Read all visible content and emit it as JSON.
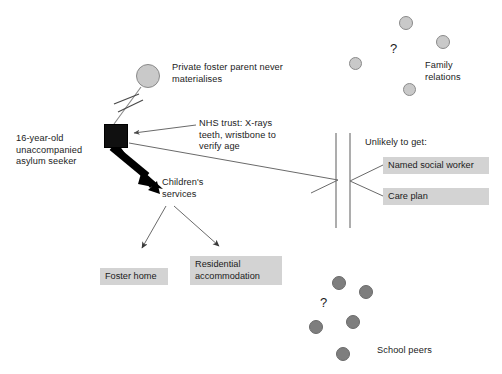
{
  "diagram": {
    "title_text": "",
    "canvas": {
      "width": 502,
      "height": 374,
      "background": "#ffffff"
    },
    "colors": {
      "ink": "#1b1b1b",
      "line": "#7a7a7a",
      "thick_arrow": "#000000",
      "box_fill": "#d3d3d3",
      "node_square_fill": "#101010",
      "circle_light_fill": "#c9c9c9",
      "circle_light_stroke": "#8a8a8a",
      "circle_dark_fill": "#7e7e7e",
      "circle_dark_stroke": "#6a6a6a"
    }
  },
  "labels": {
    "focal_person": "16-year-old\nunaccompanied\nasylum seeker",
    "private_foster_parent": "Private foster parent never\nmaterialises",
    "nhs_trust": "NHS trust: X-rays\nteeth, wristbone to\nverify age",
    "childrens_services": "Children's\nservices",
    "unlikely_to_get": "Unlikely to get:",
    "family_relations": "Family\nrelations",
    "school_peers": "School peers",
    "question_family": "?",
    "question_peers": "?"
  },
  "boxes": {
    "named_social_worker": "Named social worker",
    "care_plan": "Care plan",
    "foster_home": "Foster home",
    "residential_accommodation": "Residential\naccommodation"
  },
  "nodes": {
    "focal_square": {
      "name": "focal-person-node",
      "x": 104,
      "y": 124,
      "size": 24,
      "shape": "square",
      "fill": "dark"
    },
    "foster_parent_circle": {
      "name": "private-foster-parent-node",
      "cx": 148,
      "cy": 76,
      "r": 12,
      "shape": "circle",
      "fill": "light"
    }
  },
  "clusters": {
    "family_relations": {
      "fill": "light",
      "circles": [
        {
          "cx": 406,
          "cy": 23,
          "r": 7
        },
        {
          "cx": 443,
          "cy": 42,
          "r": 7
        },
        {
          "cx": 355,
          "cy": 63,
          "r": 6.5
        },
        {
          "cx": 409,
          "cy": 89,
          "r": 6.5
        }
      ],
      "question_pos": {
        "x": 390,
        "y": 48
      }
    },
    "school_peers": {
      "fill": "dark",
      "circles": [
        {
          "cx": 339,
          "cy": 283,
          "r": 7
        },
        {
          "cx": 366,
          "cy": 292,
          "r": 7
        },
        {
          "cx": 316,
          "cy": 327,
          "r": 7
        },
        {
          "cx": 353,
          "cy": 322,
          "r": 7
        },
        {
          "cx": 343,
          "cy": 354,
          "r": 7
        }
      ],
      "question_pos": {
        "x": 322,
        "y": 302
      }
    }
  },
  "connections": [
    {
      "name": "focal-to-foster-parent",
      "type": "severed-link",
      "note": "line crossed by two hatch marks indicating broken relationship"
    },
    {
      "name": "nhs-trust-to-focal",
      "type": "arrow"
    },
    {
      "name": "focal-to-childrens-services",
      "type": "thick-arrow"
    },
    {
      "name": "focal-to-barrier",
      "type": "line"
    },
    {
      "name": "childrens-services-to-foster-home",
      "type": "arrow"
    },
    {
      "name": "childrens-services-to-residential",
      "type": "arrow"
    },
    {
      "name": "barrier-to-named-social-worker",
      "type": "line"
    },
    {
      "name": "barrier-to-care-plan",
      "type": "line"
    },
    {
      "name": "access-barrier",
      "type": "double-vertical-line"
    }
  ]
}
